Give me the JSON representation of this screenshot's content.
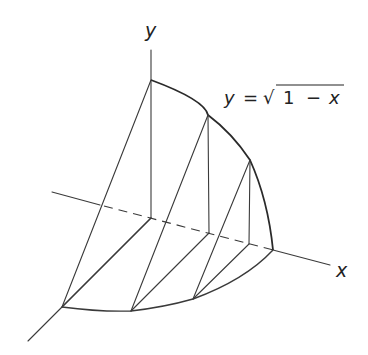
{
  "figure": {
    "axes": {
      "x_label": "x",
      "y_label": "y"
    },
    "equation": {
      "lhs": "y",
      "equals": "=",
      "radical": "√",
      "radicand_one": "1",
      "minus": "−",
      "radicand_var": "x",
      "full_text": "y = √1 − x"
    },
    "cross_sections": [
      {
        "name": "section-at-origin",
        "top": [
          151,
          80
        ],
        "base_on_x_axis": [
          151,
          218
        ],
        "base_front": [
          62,
          307
        ]
      },
      {
        "name": "section-2",
        "top": [
          208,
          115
        ],
        "base_on_x_axis": [
          209,
          233
        ],
        "base_front": [
          131,
          311
        ]
      },
      {
        "name": "section-3",
        "top": [
          250,
          160
        ],
        "base_on_x_axis": [
          249,
          244
        ],
        "base_front": [
          193,
          299
        ]
      }
    ],
    "colors": {
      "background": "#ffffff",
      "ink": "#2a2a2a"
    }
  }
}
